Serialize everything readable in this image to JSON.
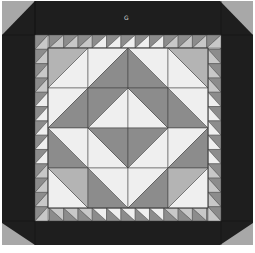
{
  "quilt": {
    "label": "G",
    "colors": {
      "background": "#ffffff",
      "border_dark": "#1e1e1e",
      "corner_gray": "#a8a8a8",
      "light": "#efefef",
      "mid": "#b4b4b4",
      "dark": "#8c8c8c",
      "seam": "#3a3a3a"
    },
    "frame": {
      "x": 2,
      "y": 1,
      "w": 251,
      "h": 244
    },
    "sawtooth": {
      "outer": 35,
      "inner": 48,
      "far_inner": 208,
      "far_outer": 221,
      "count": 12
    },
    "grid": {
      "x": 48,
      "y": 48,
      "cell": 40,
      "rows": 4,
      "cols": 4
    },
    "cells": [
      [
        {
          "dir": "/",
          "a": "mid",
          "b": "light"
        },
        {
          "dir": "/",
          "a": "light",
          "b": "dark"
        },
        {
          "dir": "\\",
          "a": "dark",
          "b": "light"
        },
        {
          "dir": "\\",
          "a": "light",
          "b": "mid"
        }
      ],
      [
        {
          "dir": "/",
          "a": "light",
          "b": "dark"
        },
        {
          "dir": "/",
          "a": "dark",
          "b": "light"
        },
        {
          "dir": "\\",
          "a": "light",
          "b": "dark"
        },
        {
          "dir": "\\",
          "a": "dark",
          "b": "light"
        }
      ],
      [
        {
          "dir": "\\",
          "a": "dark",
          "b": "light"
        },
        {
          "dir": "\\",
          "a": "light",
          "b": "dark"
        },
        {
          "dir": "/",
          "a": "dark",
          "b": "light"
        },
        {
          "dir": "/",
          "a": "light",
          "b": "dark"
        }
      ],
      [
        {
          "dir": "\\",
          "a": "light",
          "b": "mid"
        },
        {
          "dir": "\\",
          "a": "dark",
          "b": "light"
        },
        {
          "dir": "/",
          "a": "light",
          "b": "dark"
        },
        {
          "dir": "/",
          "a": "mid",
          "b": "light"
        }
      ]
    ]
  }
}
